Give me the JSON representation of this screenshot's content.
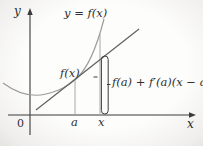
{
  "figure": {
    "colors": {
      "ink": "#2e2e2e",
      "axis": "#3a3a3a",
      "curve": "#9b9b9b",
      "tangent": "#606060",
      "guide": "#a8a8a8",
      "bracket": "#3c3c3c",
      "background": "#fdfdfc"
    },
    "labels": {
      "y_axis": "y",
      "x_axis": "x",
      "origin": "0",
      "curve_equation": "y = f(x)",
      "a_tick": "a",
      "x_tick": "x",
      "curve_height": "f(x)",
      "tangent_height": "f(a) + f′(a)(x − a)"
    }
  }
}
